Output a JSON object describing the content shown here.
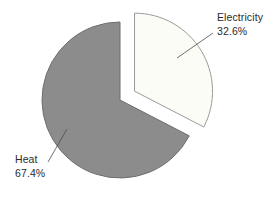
{
  "figure": {
    "background_color": "#ffffff",
    "label_color": "#2b2b2b",
    "leader_line_color": "#4a4a4a"
  },
  "chart_data": {
    "type": "pie",
    "title": "",
    "legend": "none",
    "start_angle_deg": 90,
    "direction": "clockwise",
    "center_x": 120,
    "center_y": 100,
    "radius": 78,
    "categories": [
      "Electricity",
      "Heat"
    ],
    "values": [
      32.6,
      67.4
    ],
    "slices": [
      {
        "label": "Electricity",
        "value_pct": 32.6,
        "display_pct": "32.6%",
        "fill": "#fcfcf6",
        "stroke": "#9b9b9b",
        "explode_px": 17
      },
      {
        "label": "Heat",
        "value_pct": 67.4,
        "display_pct": "67.4%",
        "fill": "#8c8c8c",
        "stroke": "#6f6f6f",
        "explode_px": 0
      }
    ],
    "annotations": [
      {
        "slice": "Electricity",
        "label_left": 217,
        "label_top": 10,
        "leader_line": {
          "x1": 213,
          "y1": 33,
          "x2": 177,
          "y2": 58
        }
      },
      {
        "slice": "Heat",
        "label_left": 15,
        "label_top": 152,
        "leader_line": {
          "x1": 48,
          "y1": 162,
          "x2": 67,
          "y2": 129
        }
      }
    ]
  }
}
